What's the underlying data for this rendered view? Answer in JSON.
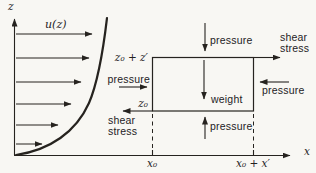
{
  "palette": {
    "background": "#f8f7f3",
    "ink": "#26231f"
  },
  "axes": {
    "z_label": "z",
    "x_label": "x",
    "x_tick_left": "x₀",
    "x_tick_right": "x₀ + x′"
  },
  "profile": {
    "label": "u(z)"
  },
  "box": {
    "top_left_label": "z₀ + z′",
    "bottom_left_label": "z₀"
  },
  "forces": {
    "pressure_top": "pressure",
    "pressure_bottom": "pressure",
    "pressure_left": "pressure",
    "pressure_right": "pressure",
    "weight": "weight",
    "shear_top": "shear\nstress",
    "shear_bottom": "shear\nstress"
  }
}
